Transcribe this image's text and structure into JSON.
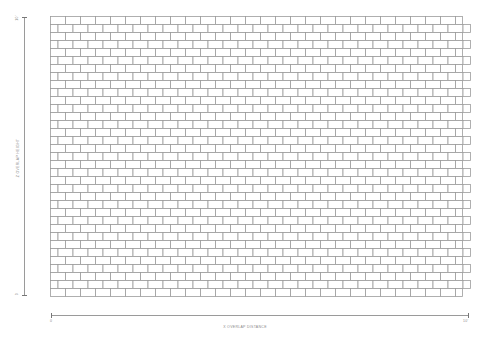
{
  "diagram": {
    "type": "running-bond brick pattern",
    "grid": {
      "left": 50,
      "top": 16,
      "rows": 35,
      "row_height": 8,
      "brick_width": 15,
      "even_row_end": 462,
      "odd_row_start_offset": 7.5,
      "odd_row_end": 470,
      "line_color": "#9c9c9c",
      "fill_color": "#ffffff"
    },
    "x_axis": {
      "label": "X OVERLAP DISTANCE",
      "start_tick": "0",
      "end_tick": "10'"
    },
    "y_axis": {
      "label": "Z OVERLAP HEIGHT",
      "start_tick": "0",
      "end_tick": "10'"
    }
  }
}
